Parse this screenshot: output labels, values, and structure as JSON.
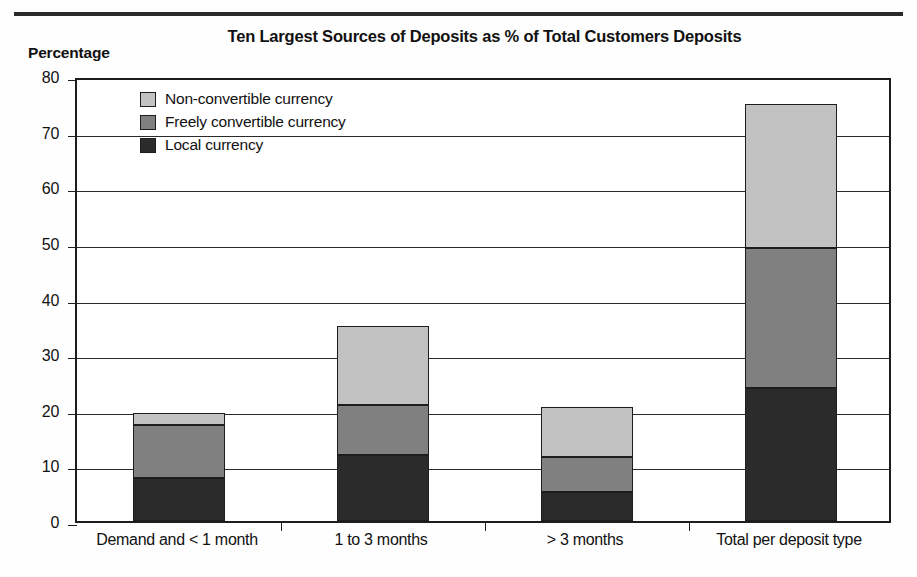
{
  "chart_data": {
    "type": "bar",
    "subtype": "stacked-bar",
    "title": "Ten Largest Sources of Deposits as % of Total Customers Deposits",
    "xlabel": "",
    "ylabel": "Percentage",
    "ylim": [
      0,
      80
    ],
    "yticks": [
      0,
      10,
      20,
      30,
      40,
      50,
      60,
      70,
      80
    ],
    "ytick_labels": [
      "0",
      "10",
      "20",
      "30",
      "40",
      "50",
      "60",
      "70",
      "80"
    ],
    "grid": true,
    "grid_axis": "y",
    "legend_position": "upper-left-inside",
    "categories": [
      "Demand and < 1 month",
      "1 to 3 months",
      "> 3 months",
      "Total per deposit type"
    ],
    "series": [
      {
        "name": "Local currency",
        "color": "#2b2b2b",
        "values": [
          7.7,
          11.8,
          5.2,
          24.0
        ]
      },
      {
        "name": "Freely convertible currency",
        "color": "#808080",
        "values": [
          9.6,
          9.0,
          6.3,
          25.0
        ]
      },
      {
        "name": "Non-convertible currency",
        "color": "#c2c2c2",
        "values": [
          2.2,
          14.2,
          9.0,
          26.0
        ]
      }
    ],
    "stack_order_bottom_to_top": [
      "Local currency",
      "Freely convertible currency",
      "Non-convertible currency"
    ],
    "totals": [
      19.5,
      35.0,
      20.5,
      75.0
    ],
    "legend_entries": [
      "Non-convertible currency",
      "Freely convertible currency",
      "Local currency"
    ]
  },
  "colors": {
    "axis": "#1d1d1d",
    "grid": "#2a2a2a",
    "background": "#ffffff",
    "rule": "#2a2a2a"
  }
}
